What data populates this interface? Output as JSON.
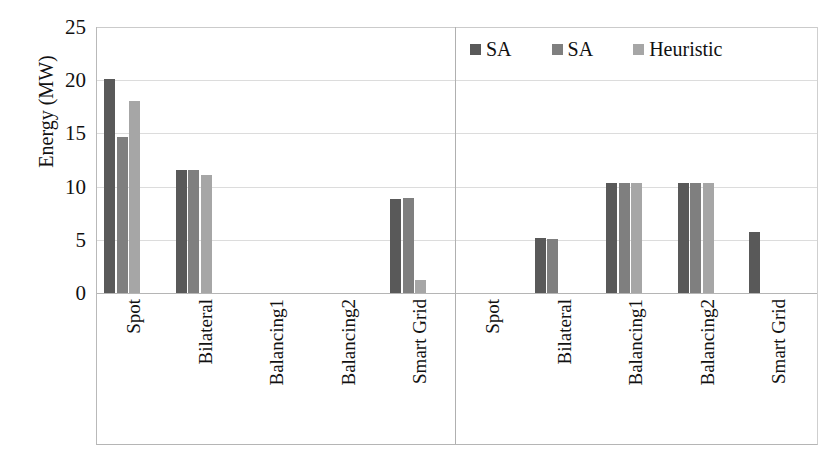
{
  "chart_data": {
    "type": "bar",
    "title": "",
    "xlabel": "",
    "ylabel": "Energy (MW)",
    "ylim": [
      0,
      25
    ],
    "yticks": [
      0,
      5,
      10,
      15,
      20,
      25
    ],
    "grid": true,
    "legend_position": "top-right",
    "panels": [
      {
        "name": "panel-1",
        "categories": [
          "Spot",
          "Bilateral",
          "Balancing1",
          "Balancing2",
          "Smart Grid"
        ],
        "series": [
          {
            "name": "SA",
            "color": "#595959",
            "values": [
              20.1,
              11.6,
              0,
              0,
              8.8
            ]
          },
          {
            "name": "SA",
            "color": "#7f7f7f",
            "values": [
              14.7,
              11.6,
              0,
              0,
              8.9
            ]
          },
          {
            "name": "Heuristic",
            "color": "#a6a6a6",
            "values": [
              18.0,
              11.1,
              0,
              0,
              1.2
            ]
          }
        ]
      },
      {
        "name": "panel-2",
        "categories": [
          "Spot",
          "Bilateral",
          "Balancing1",
          "Balancing2",
          "Smart Grid"
        ],
        "series": [
          {
            "name": "SA",
            "color": "#595959",
            "values": [
              0,
              5.2,
              10.3,
              10.3,
              5.7
            ]
          },
          {
            "name": "SA",
            "color": "#7f7f7f",
            "values": [
              0,
              5.1,
              10.3,
              10.3,
              0
            ]
          },
          {
            "name": "Heuristic",
            "color": "#a6a6a6",
            "values": [
              0,
              0,
              10.3,
              10.3,
              0
            ]
          }
        ]
      }
    ],
    "legend": [
      {
        "label": "SA",
        "color": "#595959"
      },
      {
        "label": "SA",
        "color": "#7f7f7f"
      },
      {
        "label": "Heuristic",
        "color": "#a6a6a6"
      }
    ]
  }
}
